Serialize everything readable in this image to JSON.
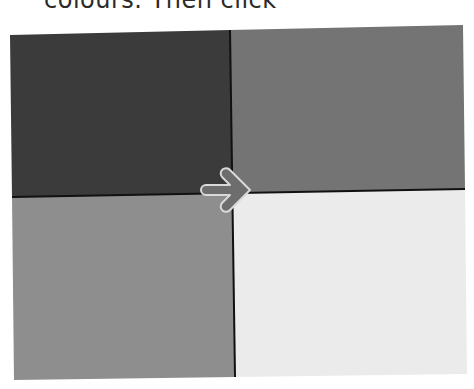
{
  "caption": {
    "text": "colours. Then click"
  },
  "grid": {
    "quadrants": [
      {
        "name": "top-left",
        "color": "#3b3b3b"
      },
      {
        "name": "top-right",
        "color": "#747474"
      },
      {
        "name": "bottom-left",
        "color": "#8e8e8e"
      },
      {
        "name": "bottom-right",
        "color": "#ebebeb"
      }
    ],
    "divider_color": "#111111"
  },
  "arrow": {
    "icon": "arrow-right-icon",
    "fill": "#6d6d6d",
    "outline": "#d9d9d9"
  }
}
